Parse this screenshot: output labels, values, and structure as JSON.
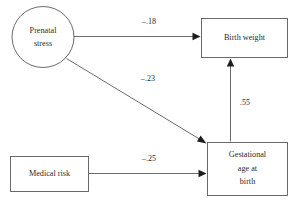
{
  "diagram": {
    "type": "path-diagram",
    "background_color": "#ffffff",
    "line_color": "#5a5a5a",
    "text_color": "#2b2b2b",
    "nodes": [
      {
        "id": "prenatal-stress",
        "shape": "ellipse",
        "label_lines": [
          "Prenatal",
          "stress"
        ],
        "line1": "Prenatal",
        "line2": "stress"
      },
      {
        "id": "birth-weight",
        "shape": "rectangle",
        "label_lines": [
          "Birth weight"
        ],
        "line1": "Birth weight"
      },
      {
        "id": "gestational-age-at-birth",
        "shape": "rectangle",
        "label_lines": [
          "Gestational",
          "age at",
          "birth"
        ],
        "line1": "Gestational",
        "line2": "age at",
        "line3": "birth"
      },
      {
        "id": "medical-risk",
        "shape": "rectangle",
        "label_lines": [
          "Medical risk"
        ],
        "line1": "Medical risk"
      }
    ],
    "edges": [
      {
        "id": "prenatal-stress-to-birth-weight",
        "from": "prenatal-stress",
        "to": "birth-weight",
        "coefficient": "–.18",
        "value": -0.18
      },
      {
        "id": "prenatal-stress-to-gestational-age",
        "from": "prenatal-stress",
        "to": "gestational-age-at-birth",
        "coefficient": "–.23",
        "value": -0.23
      },
      {
        "id": "gestational-age-to-birth-weight",
        "from": "gestational-age-at-birth",
        "to": "birth-weight",
        "coefficient": ".55",
        "value": 0.55
      },
      {
        "id": "medical-risk-to-gestational-age",
        "from": "medical-risk",
        "to": "gestational-age-at-birth",
        "coefficient": "–.25",
        "value": -0.25
      }
    ]
  }
}
